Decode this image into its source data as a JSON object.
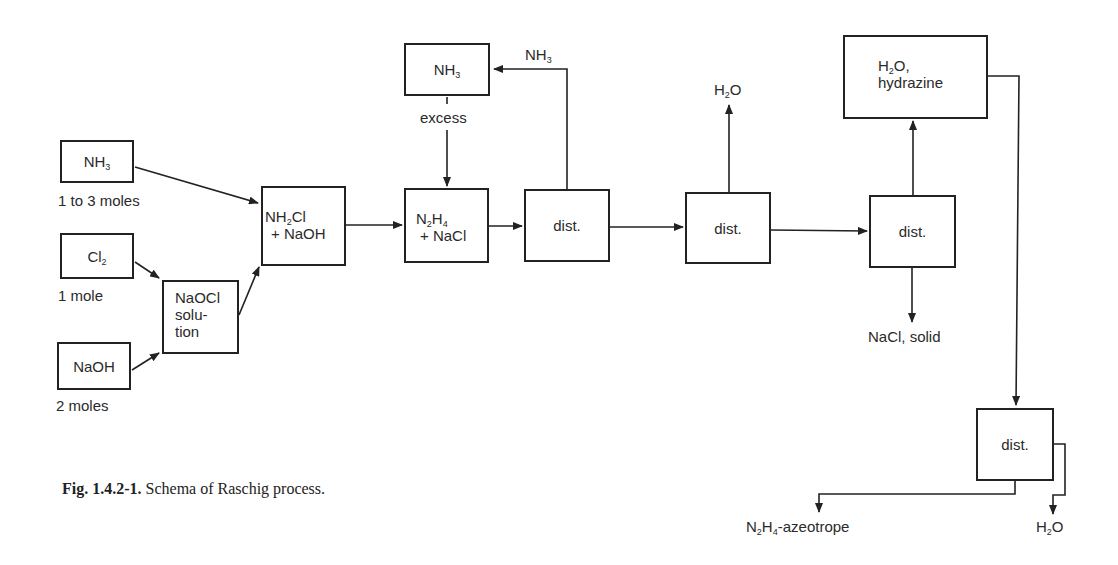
{
  "diagram": {
    "nodes": {
      "nh3_feed": {
        "formula_main": "NH",
        "formula_sub": "3",
        "note": "1 to 3 moles"
      },
      "cl2_feed": {
        "formula_main": "Cl",
        "formula_sub": "2",
        "note": "1 mole"
      },
      "naoh_feed": {
        "label": "NaOH",
        "note": "2 moles"
      },
      "naocl": {
        "line1": "NaOCl",
        "line2": "solu-",
        "line3": "tion"
      },
      "nh2cl": {
        "line1_a": "NH",
        "line1_sub": "2",
        "line1_b": "Cl",
        "line2": "+ NaOH"
      },
      "n2h4": {
        "line1_a": "N",
        "line1_sub1": "2",
        "line1_b": "H",
        "line1_sub2": "4",
        "line2": "+ NaCl"
      },
      "nh3_excess": {
        "formula_main": "NH",
        "formula_sub": "3",
        "note": "excess"
      },
      "dist1": {
        "label": "dist."
      },
      "dist2": {
        "label": "dist."
      },
      "dist3": {
        "label": "dist."
      },
      "h2o_hydrazine": {
        "line1_a": "H",
        "line1_sub": "2",
        "line1_b": "O,",
        "line2": "hydrazine"
      },
      "dist4": {
        "label": "dist."
      }
    },
    "stream_labels": {
      "nh3_recycle": {
        "main": "NH",
        "sub": "3"
      },
      "h2o_top": {
        "a": "H",
        "sub": "2",
        "b": "O"
      },
      "nacl_solid": "NaCl, solid",
      "azeotrope": {
        "a": "N",
        "sub1": "2",
        "b": "H",
        "sub2": "4",
        "c": "-azeotrope"
      },
      "h2o_bottom": {
        "a": "H",
        "sub": "2",
        "b": "O"
      }
    }
  },
  "caption": {
    "number": "Fig. 1.4.2-1.",
    "text": "Schema of Raschig process."
  }
}
